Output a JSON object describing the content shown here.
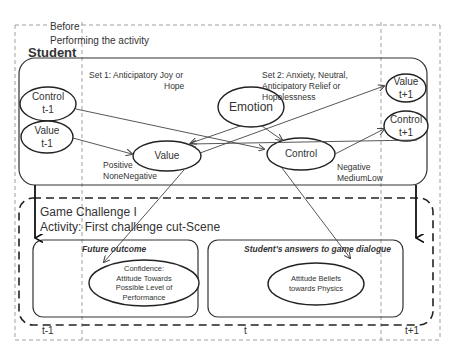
{
  "diagram": {
    "header": {
      "phase_label_line1": "Before",
      "phase_label_line2": "Performing the activity",
      "student_title": "Student"
    },
    "set_labels": {
      "set1_line1": "Set 1: Anticipatory Joy or",
      "set1_line2": "Hope",
      "set2_line1": "Set 2: Anxiety, Neutral,",
      "set2_line2": "Anticipatory Relief or",
      "set2_line3": "Hopelessness"
    },
    "nodes": {
      "control_prev": {
        "line1": "Control",
        "line2": "t-1"
      },
      "value_prev": {
        "line1": "Value",
        "line2": "t-1"
      },
      "emotion": {
        "label": "Emotion"
      },
      "value": {
        "label": "Value"
      },
      "control": {
        "label": "Control"
      },
      "value_next": {
        "line1": "Value",
        "line2": "t+1"
      },
      "control_next": {
        "line1": "Control",
        "line2": "t+1"
      }
    },
    "value_levels": {
      "line1": "Positive",
      "line2": "NoneNegative"
    },
    "control_levels": {
      "line1": "Negative",
      "line2": "MediumLow"
    },
    "game": {
      "title": "Game Challenge I",
      "activity": "Activity: First  challenge cut-Scene",
      "future_outcome": {
        "title": "Future outcome",
        "ellipse_lines": [
          "Confidence:",
          "Attitude Towards",
          "Possible Level of",
          "Performance"
        ]
      },
      "answers": {
        "title": "Student's answers to game dialogue",
        "ellipse_lines": [
          "Attitude Beliefs",
          "towards Physics"
        ]
      }
    },
    "time_labels": {
      "prev": "t-1",
      "current": "t",
      "next": "t+1"
    },
    "colors": {
      "line": "#333333",
      "dashed": "#888888",
      "background": "#ffffff"
    }
  }
}
